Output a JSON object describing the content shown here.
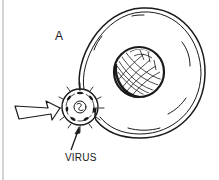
{
  "diagram": {
    "panel_label": "A",
    "callouts": [
      {
        "id": "virus",
        "text": "VIRUS"
      }
    ],
    "elements": [
      {
        "name": "host-cell",
        "description": "large round cell with membrane"
      },
      {
        "name": "nucleus",
        "description": "cross-hatched nucleus inside cell"
      },
      {
        "name": "virus",
        "description": "spiked virus particle attaching to cell membrane"
      },
      {
        "name": "approach-arrow",
        "description": "hollow arrow pointing at virus"
      }
    ],
    "colors": {
      "ink": "#1a1a1a",
      "background": "#ffffff",
      "rule": "#d4d4d4"
    }
  }
}
